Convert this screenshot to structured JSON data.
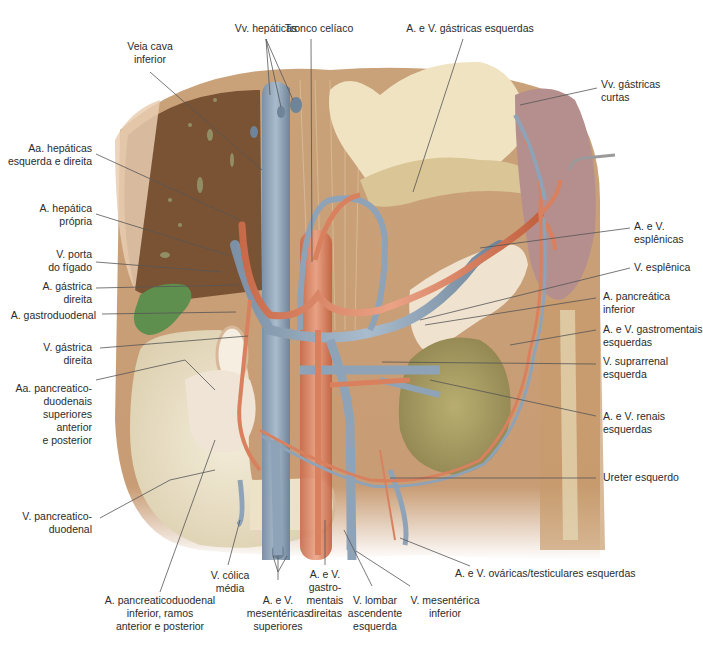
{
  "figure": {
    "type": "anatomical-illustration"
  },
  "labels": {
    "top": {
      "vv_hepaticas": {
        "lines": [
          "Vv. hepáticas"
        ]
      },
      "tronco_celiaco": {
        "lines": [
          "Tronco celíaco"
        ]
      },
      "gastricas_esquerdas": {
        "lines": [
          "A. e V. gástricas esquerdas"
        ]
      },
      "veia_cava": {
        "lines": [
          "Veia cava",
          "inferior"
        ]
      }
    },
    "left": {
      "hepaticas_esq_dir": {
        "lines": [
          "Aa. hepáticas",
          "esquerda e direita"
        ]
      },
      "hepatica_propria": {
        "lines": [
          "A. hepática",
          "própria"
        ]
      },
      "porta_figado": {
        "lines": [
          "V. porta",
          "do fígado"
        ]
      },
      "gastrica_direita_a": {
        "lines": [
          "A. gástrica",
          "direita"
        ]
      },
      "gastroduodenal": {
        "lines": [
          "A. gastroduodenal"
        ]
      },
      "gastrica_direita_v": {
        "lines": [
          "V. gástrica",
          "direita"
        ]
      },
      "pancreaticoduodenais_sup": {
        "lines": [
          "Aa. pancreatico-",
          "duodenais",
          "superiores",
          "anterior",
          "e posterior"
        ]
      },
      "pancreaticoduodenal_v": {
        "lines": [
          "V. pancreatico-",
          "duodenal"
        ]
      }
    },
    "right": {
      "gastricas_curtas": {
        "lines": [
          "Vv. gástricas",
          "curtas"
        ]
      },
      "esplenicas": {
        "lines": [
          "A. e V.",
          "esplênicas"
        ]
      },
      "v_esplenica": {
        "lines": [
          "V. esplênica"
        ]
      },
      "pancreatica_inferior": {
        "lines": [
          "A. pancreática",
          "inferior"
        ]
      },
      "gastromentais_esq": {
        "lines": [
          "A. e V. gastromentais",
          "esquerdas"
        ]
      },
      "suprarrenal_esq": {
        "lines": [
          "V. suprarrenal",
          "esquerda"
        ]
      },
      "renais_esq": {
        "lines": [
          "A. e V. renais",
          "esquerdas"
        ]
      },
      "ureter_esq": {
        "lines": [
          "Ureter esquerdo"
        ]
      },
      "ovaricas": {
        "lines": [
          "A. e V. ováricas/testiculares esquerdas"
        ]
      }
    },
    "bottom": {
      "pancreaticoduodenal_inf": {
        "lines": [
          "A. pancreaticoduodenal",
          "inferior, ramos",
          "anterior e posterior"
        ]
      },
      "colica_media": {
        "lines": [
          "V. cólica",
          "média"
        ]
      },
      "mesentericas_sup": {
        "lines": [
          "A. e V.",
          "mesentéricas",
          "superiores"
        ]
      },
      "gastromentais_dir": {
        "lines": [
          "A. e V.",
          "gastro-",
          "mentais",
          "direitas"
        ]
      },
      "lombar_asc": {
        "lines": [
          "V. lombar",
          "ascendente",
          "esquerda"
        ]
      },
      "mesenterica_inf": {
        "lines": [
          "V. mesentérica",
          "inferior"
        ]
      }
    }
  },
  "colors": {
    "artery": "#d9805e",
    "vein": "#8fa3b8",
    "liver": "#7a5334",
    "stomach": "#efe3c2",
    "spleen": "#b58f8d",
    "gallbladder": "#5f8f4e",
    "kidney": "#a69a5e",
    "muscle": "#c9a47a",
    "leader": "#555555",
    "text": "#2b2b2b"
  }
}
